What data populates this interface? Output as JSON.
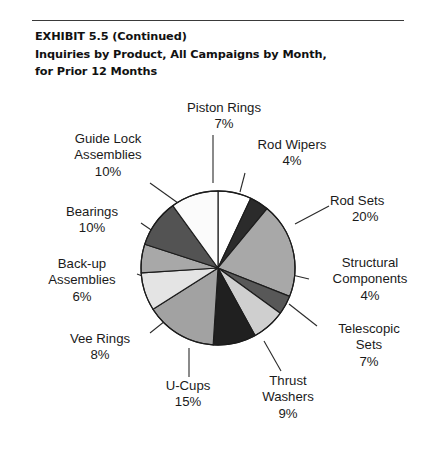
{
  "header": {
    "line1": "EXHIBIT 5.5 (Continued)",
    "line2": "Inquiries by Product, All Campaigns by Month,",
    "line3": "for Prior 12 Months"
  },
  "chart_data": {
    "type": "pie",
    "title": "Inquiries by Product, All Campaigns by Month, for Prior 12 Months",
    "xlabel": "",
    "ylabel": "",
    "grid": false,
    "legend_position": "none (labels with leader lines around pie)",
    "units": "percent",
    "start_angle_deg": 0,
    "direction": "clockwise",
    "categories": [
      "Piston Rings",
      "Rod Wipers",
      "Rod Sets",
      "Structural Components",
      "Telescopic Sets",
      "Thrust Washers",
      "U-Cups",
      "Vee Rings",
      "Back-up Assemblies",
      "Bearings",
      "Guide Lock Assemblies"
    ],
    "values": [
      7,
      4,
      20,
      4,
      7,
      9,
      15,
      8,
      6,
      10,
      10
    ],
    "value_labels": [
      "7%",
      "4%",
      "20%",
      "4%",
      "7%",
      "9%",
      "15%",
      "8%",
      "6%",
      "10%",
      "10%"
    ],
    "colors": [
      "#ffffff",
      "#2b2b2b",
      "#a8a8a8",
      "#585858",
      "#cfcfcf",
      "#202020",
      "#a2a2a2",
      "#e4e4e4",
      "#a8a8a8",
      "#535353",
      "#fbfbfb"
    ],
    "slice_outline_color": "#1c1c1c",
    "slices": [
      {
        "label": "Piston Rings",
        "percent_text": "7%",
        "value": 7,
        "color": "#ffffff"
      },
      {
        "label": "Rod Wipers",
        "percent_text": "4%",
        "value": 4,
        "color": "#2b2b2b"
      },
      {
        "label": "Rod Sets",
        "percent_text": "20%",
        "value": 20,
        "color": "#a8a8a8"
      },
      {
        "label": "Structural Components",
        "percent_text": "4%",
        "value": 4,
        "color": "#585858"
      },
      {
        "label": "Telescopic Sets",
        "percent_text": "7%",
        "value": 7,
        "color": "#cfcfcf"
      },
      {
        "label": "Thrust Washers",
        "percent_text": "9%",
        "value": 9,
        "color": "#202020"
      },
      {
        "label": "U-Cups",
        "percent_text": "15%",
        "value": 15,
        "color": "#a2a2a2"
      },
      {
        "label": "Vee Rings",
        "percent_text": "8%",
        "value": 8,
        "color": "#e4e4e4"
      },
      {
        "label": "Back-up Assemblies",
        "percent_text": "6%",
        "value": 6,
        "color": "#a8a8a8"
      },
      {
        "label": "Bearings",
        "percent_text": "10%",
        "value": 10,
        "color": "#535353"
      },
      {
        "label": "Guide Lock Assemblies",
        "percent_text": "10%",
        "value": 10,
        "color": "#fbfbfb"
      }
    ]
  },
  "labels": {
    "piston_rings": {
      "name": "Piston Rings",
      "pct": "7%"
    },
    "rod_wipers": {
      "name": "Rod Wipers",
      "pct": "4%"
    },
    "rod_sets": {
      "name": "Rod Sets",
      "pct": "20%"
    },
    "structural": {
      "name1": "Structural",
      "name2": "Components",
      "pct": "4%"
    },
    "telescopic": {
      "name1": "Telescopic",
      "name2": "Sets",
      "pct": "7%"
    },
    "thrust_washers": {
      "name1": "Thrust",
      "name2": "Washers",
      "pct": "9%"
    },
    "u_cups": {
      "name": "U-Cups",
      "pct": "15%"
    },
    "vee_rings": {
      "name": "Vee Rings",
      "pct": "8%"
    },
    "backup": {
      "name1": "Back-up",
      "name2": "Assemblies",
      "pct": "6%"
    },
    "bearings": {
      "name": "Bearings",
      "pct": "10%"
    },
    "guide_lock": {
      "name1": "Guide Lock",
      "name2": "Assemblies",
      "pct": "10%"
    }
  }
}
